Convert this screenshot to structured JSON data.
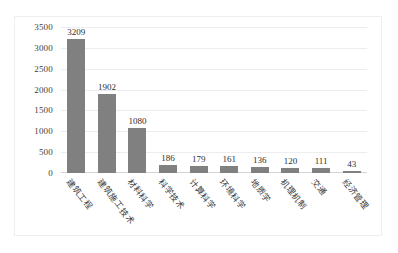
{
  "chart_data": {
    "type": "bar",
    "title": "",
    "subtitle": "",
    "xlabel": "",
    "ylabel": "",
    "orientation": "vertical",
    "grid": true,
    "legend": false,
    "ylim": [
      0,
      3500
    ],
    "yticks": [
      0,
      500,
      1000,
      1500,
      2000,
      2500,
      3000,
      3500
    ],
    "ytick_labels": [
      "0",
      "500",
      "1000",
      "1500",
      "2000",
      "2500",
      "3000",
      "3500"
    ],
    "categories": [
      "建筑工程",
      "建筑施工技术",
      "材料科学",
      "科学技术",
      "计算科学",
      "环境科学",
      "地质学",
      "机理机制",
      "交通",
      "经济管理"
    ],
    "values": [
      3209,
      1902,
      1080,
      186,
      179,
      161,
      136,
      120,
      111,
      43
    ],
    "data_labels": [
      "3209",
      "1902",
      "1080",
      "186",
      "179",
      "161",
      "136",
      "120",
      "111",
      "43"
    ],
    "colors": {
      "bar": "#808080",
      "gridline": "#ededf0",
      "axis": "#d2d4d8",
      "border": "#eceef0",
      "text": "#3f3f3f",
      "background": "#ffffff"
    }
  }
}
